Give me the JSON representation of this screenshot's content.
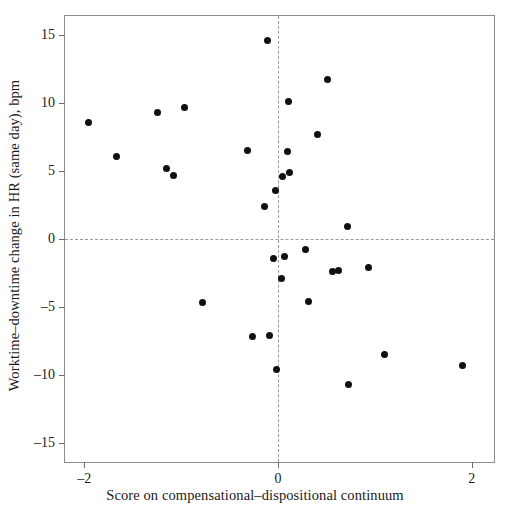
{
  "chart_data": {
    "type": "scatter",
    "title": "",
    "xlabel": "Score on compensational–dispositional continuum",
    "ylabel": "Worktime–downtime change in HR (same day), bpm",
    "xlim": [
      -2.2,
      2.23
    ],
    "ylim": [
      -16.4,
      16.4
    ],
    "xticks": [
      -2,
      0,
      2
    ],
    "xticklabels": [
      "–2",
      "0",
      "2"
    ],
    "yticks": [
      15,
      10,
      5,
      0,
      -5,
      -10,
      -15
    ],
    "yticklabels": [
      "15",
      "10",
      "5",
      "0",
      "–5",
      "–10",
      "–15"
    ],
    "grid": false,
    "legend": false,
    "reference_lines": [
      {
        "axis": "x",
        "value": 0,
        "style": "dashed"
      },
      {
        "axis": "y",
        "value": 0,
        "style": "dashed"
      }
    ],
    "marker": {
      "shape": "circle",
      "color": "#101010",
      "size_px": 7
    },
    "series": [
      {
        "name": "participants",
        "points": [
          {
            "x": -1.96,
            "y": 8.6
          },
          {
            "x": -1.67,
            "y": 6.1
          },
          {
            "x": -1.24,
            "y": 9.3
          },
          {
            "x": -1.15,
            "y": 5.2
          },
          {
            "x": -1.08,
            "y": 4.7
          },
          {
            "x": -0.97,
            "y": 9.7
          },
          {
            "x": -0.78,
            "y": -4.7
          },
          {
            "x": -0.32,
            "y": 6.5
          },
          {
            "x": -0.26,
            "y": -7.2
          },
          {
            "x": -0.14,
            "y": 2.4
          },
          {
            "x": -0.11,
            "y": 14.6
          },
          {
            "x": -0.09,
            "y": -7.1
          },
          {
            "x": -0.05,
            "y": -1.4
          },
          {
            "x": -0.03,
            "y": 3.6
          },
          {
            "x": -0.02,
            "y": -9.6
          },
          {
            "x": 0.04,
            "y": -2.9
          },
          {
            "x": 0.05,
            "y": 4.6
          },
          {
            "x": 0.07,
            "y": -1.3
          },
          {
            "x": 0.1,
            "y": 6.4
          },
          {
            "x": 0.11,
            "y": 10.1
          },
          {
            "x": 0.12,
            "y": 4.9
          },
          {
            "x": 0.28,
            "y": -0.8
          },
          {
            "x": 0.31,
            "y": -4.6
          },
          {
            "x": 0.41,
            "y": 7.7
          },
          {
            "x": 0.51,
            "y": 11.7
          },
          {
            "x": 0.56,
            "y": -2.4
          },
          {
            "x": 0.62,
            "y": -2.3
          },
          {
            "x": 0.72,
            "y": 0.9
          },
          {
            "x": 0.73,
            "y": -10.7
          },
          {
            "x": 0.93,
            "y": -2.1
          },
          {
            "x": 1.1,
            "y": -8.5
          },
          {
            "x": 1.9,
            "y": -9.3
          }
        ]
      }
    ]
  }
}
